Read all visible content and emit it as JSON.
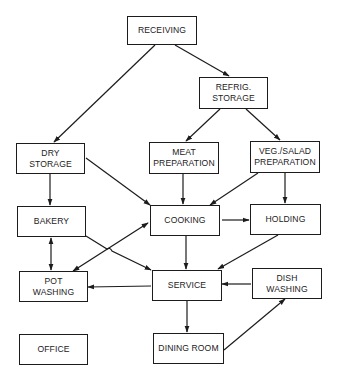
{
  "diagram": {
    "type": "flow",
    "colors": {
      "line": "#1c1c1c",
      "text": "#222222",
      "background": "#ffffff"
    },
    "nodes": {
      "receiving": {
        "line1": "RECEIVING",
        "line2": ""
      },
      "refrig": {
        "line1": "REFRIG.",
        "line2": "STORAGE"
      },
      "dry": {
        "line1": "DRY",
        "line2": "STORAGE"
      },
      "meat": {
        "line1": "MEAT",
        "line2": "PREPARATION"
      },
      "veg": {
        "line1": "VEG./SALAD",
        "line2": "PREPARATION"
      },
      "bakery": {
        "line1": "BAKERY",
        "line2": ""
      },
      "cooking": {
        "line1": "COOKING",
        "line2": ""
      },
      "holding": {
        "line1": "HOLDING",
        "line2": ""
      },
      "pot": {
        "line1": "POT",
        "line2": "WASHING"
      },
      "service": {
        "line1": "SERVICE",
        "line2": ""
      },
      "dish": {
        "line1": "DISH",
        "line2": "WASHING"
      },
      "office": {
        "line1": "OFFICE",
        "line2": ""
      },
      "dining": {
        "line1": "DINING ROOM",
        "line2": ""
      }
    },
    "edges": [
      {
        "from": "RECEIVING",
        "to": "DRY STORAGE"
      },
      {
        "from": "RECEIVING",
        "to": "REFRIG. STORAGE"
      },
      {
        "from": "REFRIG. STORAGE",
        "to": "MEAT PREPARATION"
      },
      {
        "from": "REFRIG. STORAGE",
        "to": "VEG./SALAD PREPARATION"
      },
      {
        "from": "DRY STORAGE",
        "to": "BAKERY"
      },
      {
        "from": "DRY STORAGE",
        "to": "COOKING"
      },
      {
        "from": "MEAT PREPARATION",
        "to": "COOKING"
      },
      {
        "from": "VEG./SALAD PREPARATION",
        "to": "COOKING"
      },
      {
        "from": "VEG./SALAD PREPARATION",
        "to": "HOLDING"
      },
      {
        "from": "BAKERY",
        "to": "POT WASHING",
        "bidirectional": true
      },
      {
        "from": "BAKERY",
        "to": "SERVICE"
      },
      {
        "from": "COOKING",
        "to": "POT WASHING",
        "bidirectional": true
      },
      {
        "from": "COOKING",
        "to": "HOLDING"
      },
      {
        "from": "COOKING",
        "to": "SERVICE"
      },
      {
        "from": "HOLDING",
        "to": "SERVICE"
      },
      {
        "from": "SERVICE",
        "to": "POT WASHING"
      },
      {
        "from": "DISH WASHING",
        "to": "SERVICE"
      },
      {
        "from": "SERVICE",
        "to": "DINING ROOM"
      },
      {
        "from": "DINING ROOM",
        "to": "DISH WASHING"
      }
    ]
  }
}
